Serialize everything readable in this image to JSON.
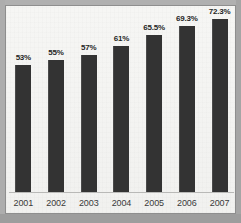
{
  "chart_data": {
    "type": "bar",
    "title": "",
    "subtitle": "",
    "xlabel": "",
    "ylabel": "",
    "grid": false,
    "legend": "none",
    "ylim": [
      0,
      80
    ],
    "categories": [
      "2001",
      "2002",
      "2003",
      "2004",
      "2005",
      "2006",
      "2007"
    ],
    "values": [
      53,
      55,
      57,
      61,
      65.5,
      69.3,
      72.3
    ],
    "data_labels": [
      "53%",
      "55%",
      "57%",
      "61%",
      "65.5%",
      "69.3%",
      "72.3%"
    ],
    "series": [
      {
        "name": "",
        "values": [
          53,
          55,
          57,
          61,
          65.5,
          69.3,
          72.3
        ]
      }
    ],
    "bar_color": "#333333",
    "plot_background": "#f4f4f2",
    "frame_color": "#8e8e8e"
  },
  "bars": [
    {
      "label": "53%",
      "year": "2001",
      "value": 53,
      "height_px": 127
    },
    {
      "label": "55%",
      "year": "2002",
      "value": 55,
      "height_px": 132
    },
    {
      "label": "57%",
      "year": "2003",
      "value": 57,
      "height_px": 137
    },
    {
      "label": "61%",
      "year": "2004",
      "value": 61,
      "height_px": 146
    },
    {
      "label": "65.5%",
      "year": "2005",
      "value": 65.5,
      "height_px": 157
    },
    {
      "label": "69.3%",
      "year": "2006",
      "value": 69.3,
      "height_px": 166
    },
    {
      "label": "72.3%",
      "year": "2007",
      "value": 72.3,
      "height_px": 173
    }
  ]
}
